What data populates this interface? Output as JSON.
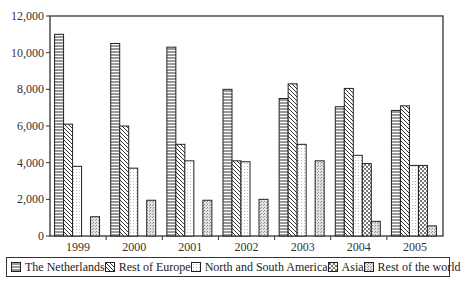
{
  "chart_data": {
    "type": "bar",
    "title": "",
    "xlabel": "",
    "ylabel": "",
    "ylim": [
      0,
      12000
    ],
    "yticks": [
      0,
      2000,
      4000,
      6000,
      8000,
      10000,
      12000
    ],
    "ytick_labels": [
      "0",
      "2,000",
      "4,000",
      "6,000",
      "8,000",
      "10,000",
      "12,000"
    ],
    "grid": false,
    "legend_position": "bottom",
    "categories": [
      "1999",
      "2000",
      "2001",
      "2002",
      "2003",
      "2004",
      "2005"
    ],
    "series": [
      {
        "name": "The Netherlands",
        "pattern": "horizontal-lines",
        "values": [
          11000,
          10500,
          10300,
          8000,
          7500,
          7050,
          6850
        ]
      },
      {
        "name": "Rest of Europe",
        "pattern": "diagonal-lines",
        "values": [
          6100,
          6000,
          5000,
          4100,
          8300,
          8050,
          7100
        ]
      },
      {
        "name": "North and South America",
        "pattern": "light-dots",
        "values": [
          3800,
          3700,
          4100,
          4050,
          5000,
          4400,
          3850
        ]
      },
      {
        "name": "Asia",
        "pattern": "checkered",
        "values": [
          0,
          0,
          0,
          0,
          0,
          3950,
          3850
        ]
      },
      {
        "name": "Rest of the world",
        "pattern": "dense-dots",
        "values": [
          1050,
          1950,
          1950,
          2000,
          4100,
          800,
          550
        ]
      }
    ]
  },
  "legend": {
    "items": [
      {
        "label": "The Netherlands"
      },
      {
        "label": "Rest of Europe"
      },
      {
        "label": "North and South America"
      },
      {
        "label": "Asia"
      },
      {
        "label": "Rest of the world"
      }
    ]
  }
}
